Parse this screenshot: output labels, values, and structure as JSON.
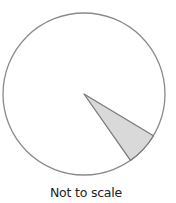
{
  "figure": {
    "type": "circle-graph",
    "caption": "Not to scale",
    "shaded_sector": {
      "start_angle_deg": 31,
      "end_angle_deg": 55,
      "angle_direction": "clockwise from east",
      "fill_color": "#d9d9d9"
    },
    "outline_color": "#8a8a8a",
    "edge_color": "#7a7a7a"
  }
}
